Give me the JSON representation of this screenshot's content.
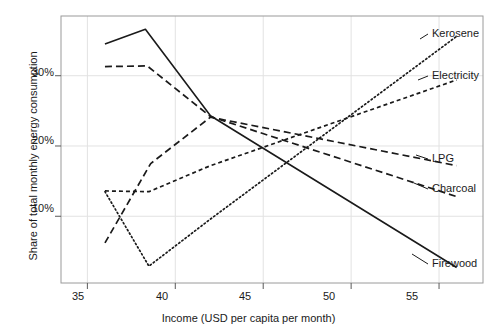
{
  "chart_data": {
    "type": "line",
    "title": "",
    "xlabel": "Income (USD per capita per month)",
    "ylabel": "Share of total monthly energy consumption",
    "xlim": [
      33.5,
      57.5
    ],
    "ylim": [
      0.5,
      38.5
    ],
    "xticks": [
      35,
      40,
      45,
      50,
      55
    ],
    "xtick_labels": [
      "35",
      "40",
      "45",
      "50",
      "55"
    ],
    "yticks": [
      10,
      20,
      30
    ],
    "ytick_labels": [
      "10%",
      "20%",
      "30%"
    ],
    "grid": true,
    "legend_position": "right-inline-labels",
    "series": [
      {
        "name": "Firewood",
        "label": "Firewood",
        "style": "solid",
        "color": "#1a1a1a",
        "x": [
          36.0,
          38.3,
          42.0,
          56.0
        ],
        "y": [
          34.5,
          36.6,
          24.3,
          2.7
        ]
      },
      {
        "name": "Charcoal",
        "label": "Charcoal",
        "style": "dashed-long",
        "color": "#1a1a1a",
        "x": [
          36.0,
          38.4,
          42.0,
          56.0
        ],
        "y": [
          31.3,
          31.4,
          24.2,
          12.8
        ]
      },
      {
        "name": "LPG",
        "label": "LPG",
        "style": "dashed-long",
        "color": "#1a1a1a",
        "x": [
          36.0,
          38.6,
          42.0,
          56.0
        ],
        "y": [
          6.2,
          17.5,
          24.1,
          17.2
        ]
      },
      {
        "name": "Electricity",
        "label": "Electricity",
        "style": "dashed-short",
        "color": "#1a1a1a",
        "x": [
          36.0,
          38.5,
          42.0,
          56.0
        ],
        "y": [
          13.6,
          13.5,
          17.2,
          29.4
        ]
      },
      {
        "name": "Kerosene",
        "label": "Kerosene",
        "style": "dotted",
        "color": "#1a1a1a",
        "x": [
          36.0,
          38.5,
          42.0,
          56.0
        ],
        "y": [
          13.5,
          2.9,
          9.6,
          35.6
        ]
      }
    ],
    "series_labels": [
      {
        "text": "Kerosene",
        "x_px": 432,
        "y_px": 34
      },
      {
        "text": "Electricity",
        "x_px": 432,
        "y_px": 76
      },
      {
        "text": "LPG",
        "x_px": 432,
        "y_px": 159
      },
      {
        "text": "Charcoal",
        "x_px": 432,
        "y_px": 189
      },
      {
        "text": "Firewood",
        "x_px": 432,
        "y_px": 264
      }
    ]
  },
  "axes": {
    "ytick_0": "10%",
    "ytick_1": "20%",
    "ytick_2": "30%",
    "xtick_0": "35",
    "xtick_1": "40",
    "xtick_2": "45",
    "xtick_3": "50",
    "xtick_4": "55",
    "xtitle": "Income (USD per capita per month)",
    "ytitle": "Share of total monthly energy consumption"
  },
  "labels": {
    "kerosene": "Kerosene",
    "electricity": "Electricity",
    "lpg": "LPG",
    "charcoal": "Charcoal",
    "firewood": "Firewood"
  }
}
